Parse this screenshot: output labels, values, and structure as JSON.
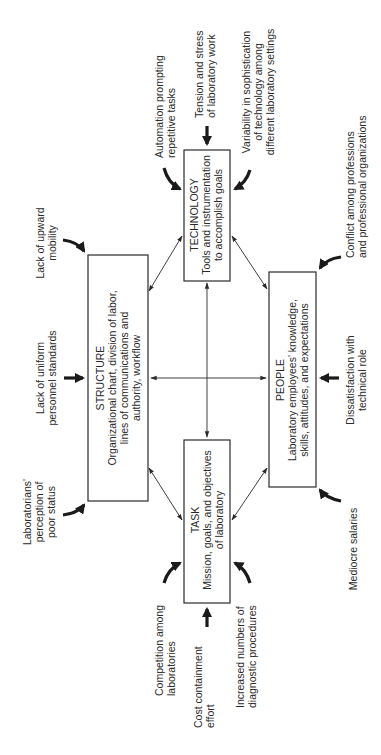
{
  "diagram": {
    "orientation": "rotated -90deg (text reads bottom-to-top)",
    "boxes": {
      "technology": {
        "title": "TECHNOLOGY",
        "lines": [
          "Tools and instrumentation",
          "to accomplish goals"
        ]
      },
      "structure": {
        "title": "STRUCTURE",
        "lines": [
          "Organizational chart, division of labor,",
          "lines of communications and",
          "authority, workflow"
        ]
      },
      "people": {
        "title": "PEOPLE",
        "lines": [
          "Laboratory employees' knowledge,",
          "skills, attitudes, and expectations"
        ]
      },
      "task": {
        "title": "TASK",
        "lines": [
          "Mission, goals, and objectives",
          "of laboratory"
        ]
      }
    },
    "pressures": {
      "automation": [
        "Automation prompting",
        "repetitive tasks"
      ],
      "tension": [
        "Tension and stress",
        "of laboratory work"
      ],
      "variability": [
        "Variability in sophistication",
        "of technology among",
        "different laboratory settings"
      ],
      "upward_mobility": [
        "Lack of upward",
        "mobility"
      ],
      "uniform_standards": [
        "Lack of uniform",
        "personnel standards"
      ],
      "poor_status": [
        "Laboratorians'",
        "perception of",
        "poor status"
      ],
      "conflict": [
        "Conflict among professions",
        "and professional organizations"
      ],
      "dissatisfaction": [
        "Dissatisfaction with",
        "technical role"
      ],
      "salaries": [
        "Mediocre salaries"
      ],
      "competition": [
        "Competition among",
        "laboratories"
      ],
      "cost_containment": [
        "Cost containment",
        "effort"
      ],
      "diagnostic": [
        "Increased numbers of",
        "diagnostic procedures"
      ]
    },
    "colors": {
      "line": "#2a2a2a",
      "background": "#ffffff"
    }
  }
}
